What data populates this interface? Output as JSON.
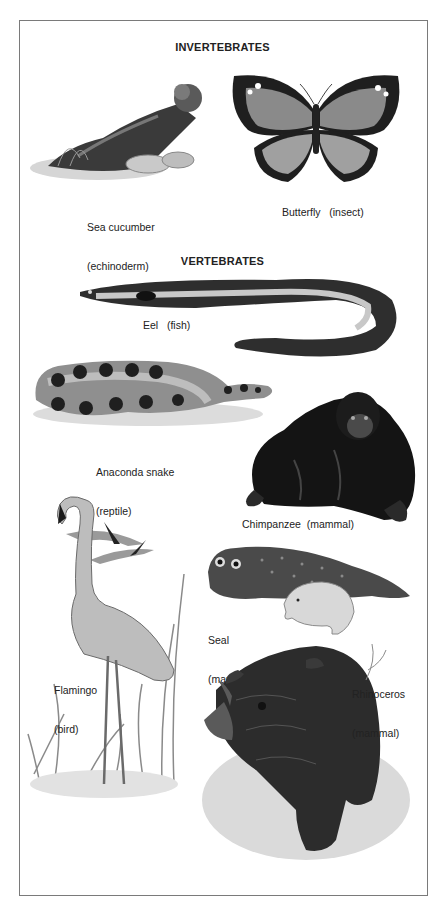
{
  "sections": {
    "invertebrates": {
      "heading": "INVERTEBRATES",
      "animals": [
        {
          "name": "Sea cucumber",
          "group": "(echinoderm)",
          "icon": "sea-cucumber-illustration"
        },
        {
          "name": "Butterfly",
          "group": "(insect)",
          "label": "Butterfly   (insect)",
          "icon": "butterfly-illustration"
        }
      ]
    },
    "vertebrates": {
      "heading": "VERTEBRATES",
      "animals": [
        {
          "name": "Eel",
          "group": "(fish)",
          "label": "Eel   (fish)",
          "icon": "eel-illustration"
        },
        {
          "name": "Anaconda snake",
          "group": "(reptile)",
          "icon": "anaconda-illustration"
        },
        {
          "name": "Chimpanzee",
          "group": "(mammal)",
          "label": "Chimpanzee  (mammal)",
          "icon": "chimpanzee-illustration"
        },
        {
          "name": "Seal",
          "group": "(mammal)",
          "icon": "seal-illustration"
        },
        {
          "name": "Flamingo",
          "group": "(bird)",
          "icon": "flamingo-illustration"
        },
        {
          "name": "Rhinoceros",
          "group": "(mammal)",
          "icon": "rhinoceros-illustration"
        }
      ]
    }
  },
  "colors": {
    "border": "#7a7a7a",
    "text": "#222222",
    "ink_dark": "#1e1e1e",
    "ink_mid": "#6a6a6a",
    "ink_light": "#b8b8b8"
  }
}
